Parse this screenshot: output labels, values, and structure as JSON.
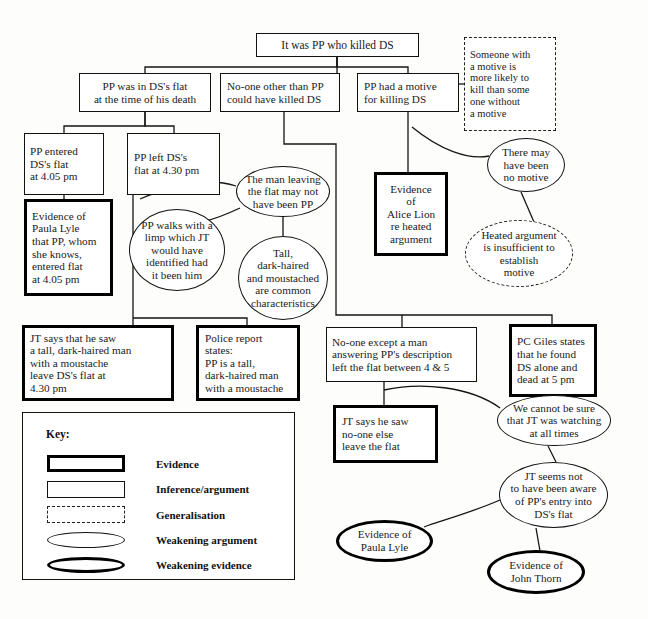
{
  "diagram": {
    "nodes": [
      {
        "id": "n1",
        "label": "It was PP who killed DS",
        "type": "inference",
        "align": "center",
        "x": 256,
        "y": 33,
        "w": 163,
        "h": 24,
        "font": 11.5,
        "pad": 4
      },
      {
        "id": "n2",
        "label": "PP was in DS's flat\nat the time of his death",
        "type": "inference",
        "align": "center",
        "x": 79,
        "y": 73,
        "w": 132,
        "h": 39,
        "font": 11.2,
        "pad": 4
      },
      {
        "id": "n3",
        "label": "No-one other than PP\ncould have killed DS",
        "type": "inference",
        "align": "left",
        "x": 220,
        "y": 73,
        "w": 120,
        "h": 39,
        "font": 11.2,
        "pad": 6
      },
      {
        "id": "n4",
        "label": "PP had a motive\nfor killing DS",
        "type": "inference",
        "align": "left",
        "x": 357,
        "y": 73,
        "w": 102,
        "h": 39,
        "font": 11.2,
        "pad": 6
      },
      {
        "id": "n5",
        "label": "Someone with\na motive is\nmore likely to\nkill than some\none without\na motive",
        "type": "generalisation",
        "align": "left",
        "x": 464,
        "y": 37,
        "w": 92,
        "h": 94,
        "font": 10.5,
        "pad": 5
      },
      {
        "id": "n6",
        "label": "PP entered\nDS's flat\nat 4.05 pm",
        "type": "inference",
        "align": "left",
        "x": 24,
        "y": 133,
        "w": 80,
        "h": 62,
        "font": 11.2,
        "pad": 5
      },
      {
        "id": "n7",
        "label": "PP left DS's\nflat at 4.30 pm",
        "type": "inference",
        "align": "left",
        "x": 127,
        "y": 133,
        "w": 93,
        "h": 62,
        "font": 11.2,
        "pad": 6
      },
      {
        "id": "n8",
        "label": "Evidence of\nPaula Lyle\nthat PP, whom\nshe knows,\nentered flat\nat 4.05 pm",
        "type": "evidence",
        "align": "left",
        "x": 24,
        "y": 199,
        "w": 89,
        "h": 97,
        "font": 11.2,
        "pad": 5
      },
      {
        "id": "n9",
        "label": "The man leaving\nthe flat may not\nhave been PP",
        "type": "wk-argument",
        "align": "center",
        "x": 236,
        "y": 166,
        "w": 94,
        "h": 51,
        "font": 11.2,
        "pad": 6
      },
      {
        "id": "n10",
        "label": "PP walks with a\nlimp which JT\nwould have\nidentified had\nit been him",
        "type": "wk-argument",
        "align": "center",
        "x": 129,
        "y": 209,
        "w": 96,
        "h": 82,
        "font": 11.2,
        "pad": 6
      },
      {
        "id": "n11",
        "label": "Tall,\ndark-haired\nand moustached\nare common\ncharacteristics",
        "type": "wk-argument",
        "align": "center",
        "x": 238,
        "y": 236,
        "w": 90,
        "h": 84,
        "font": 11.2,
        "pad": 4
      },
      {
        "id": "n12",
        "label": "Evidence\nof\nAlice Lion\nre heated\nargument",
        "type": "evidence",
        "align": "center",
        "x": 374,
        "y": 172,
        "w": 74,
        "h": 84,
        "font": 11.2,
        "pad": 4
      },
      {
        "id": "n13",
        "label": "There may\nhave been\nno motive",
        "type": "wk-argument",
        "align": "center",
        "x": 487,
        "y": 138,
        "w": 78,
        "h": 54,
        "font": 11.2,
        "pad": 4
      },
      {
        "id": "n14",
        "label": "Heated argument\nis insufficient to\nestablish\nmotive",
        "type": "generalisation-ellipse",
        "align": "center",
        "x": 465,
        "y": 220,
        "w": 108,
        "h": 67,
        "font": 11,
        "pad": 4
      },
      {
        "id": "n15",
        "label": "JT says that he saw\na tall, dark-haired man\nwith a moustache\nleave DS's flat at\n4.30 pm",
        "type": "evidence",
        "align": "left",
        "x": 22,
        "y": 325,
        "w": 152,
        "h": 76,
        "font": 11.2,
        "pad": 5
      },
      {
        "id": "n16",
        "label": "Police report\nstates:\nPP is a tall,\ndark-haired man\nwith a moustache",
        "type": "evidence",
        "align": "left",
        "x": 196,
        "y": 325,
        "w": 104,
        "h": 76,
        "font": 11.2,
        "pad": 6
      },
      {
        "id": "n17",
        "label": "No-one except a man\nanswering PP's description\nleft the flat between 4 & 5",
        "type": "inference",
        "align": "left",
        "x": 326,
        "y": 327,
        "w": 151,
        "h": 55,
        "font": 11.2,
        "pad": 5
      },
      {
        "id": "n18",
        "label": "PC Giles states\nthat he found\nDS alone and\ndead at 5 pm",
        "type": "evidence",
        "align": "left",
        "x": 509,
        "y": 324,
        "w": 88,
        "h": 73,
        "font": 11.2,
        "pad": 5
      },
      {
        "id": "n19",
        "label": "JT says he saw\nno-one else\nleave the flat",
        "type": "evidence",
        "align": "left",
        "x": 333,
        "y": 405,
        "w": 105,
        "h": 58,
        "font": 11.2,
        "pad": 6
      },
      {
        "id": "n20",
        "label": "We cannot be sure\nthat JT was watching\nat all times",
        "type": "wk-argument",
        "align": "center",
        "x": 497,
        "y": 395,
        "w": 114,
        "h": 51,
        "font": 11.2,
        "pad": 4
      },
      {
        "id": "n21",
        "label": "JT seems not\nto have been aware\nof PP's entry into\nDS's flat",
        "type": "wk-argument",
        "align": "center",
        "x": 499,
        "y": 462,
        "w": 109,
        "h": 66,
        "font": 11.2,
        "pad": 4
      },
      {
        "id": "n22",
        "label": "Evidence of\nPaula Lyle",
        "type": "wk-evidence",
        "align": "center",
        "x": 336,
        "y": 520,
        "w": 97,
        "h": 42,
        "font": 11.2,
        "pad": 4
      },
      {
        "id": "n23",
        "label": "Evidence of\nJohn Thorn",
        "type": "wk-evidence",
        "align": "center",
        "x": 487,
        "y": 550,
        "w": 98,
        "h": 44,
        "font": 11.2,
        "pad": 4
      }
    ],
    "connectors": [
      {
        "from": "n1",
        "to": "n2",
        "d": "M 337,57 L 337,67 L 145,67 L 145,73"
      },
      {
        "from": "n1",
        "to": "n3",
        "d": "M 337,57 L 337,73"
      },
      {
        "from": "n1",
        "to": "n4",
        "d": "M 337,57 L 337,67 L 408,67 L 408,73"
      },
      {
        "from": "n4",
        "to": "n5",
        "d": "M 459,84 L 464,84"
      },
      {
        "from": "n2",
        "to": "n6",
        "d": "M 145,112 L 145,126 L 64,126 L 64,133"
      },
      {
        "from": "n2",
        "to": "n7",
        "d": "M 145,112 L 145,126 L 174,126 L 174,133"
      },
      {
        "from": "n6",
        "to": "n8",
        "d": "M 64,195 L 64,199"
      },
      {
        "from": "n7",
        "to": "n15",
        "d": "M 133,195 L 133,330 L 133,332"
      },
      {
        "from": "n15",
        "to": "n16",
        "d": "M 133,318 L 247,318 L 247,325"
      },
      {
        "from": "n7",
        "to": "n9",
        "d": "M 140,199 C 170,186 205,176 236,186"
      },
      {
        "from": "n9",
        "to": "n10",
        "d": "M 240,208 C 225,215 215,219 205,221"
      },
      {
        "from": "n9",
        "to": "n11",
        "d": "M 283,217 L 283,236"
      },
      {
        "from": "n3",
        "to": "n17",
        "d": "M 284,112 L 284,144 L 336,144 L 336,315 L 402,315 L 402,327"
      },
      {
        "from": "n4",
        "to": "n12",
        "d": "M 408,112 L 408,172"
      },
      {
        "from": "n4",
        "to": "n13",
        "d": "M 412,127 C 440,150 468,160 489,156"
      },
      {
        "from": "n13",
        "to": "n14",
        "d": "M 521,192 L 534,222"
      },
      {
        "from": "n17",
        "to": "n18",
        "d": "M 402,315 L 552,315 L 552,324"
      },
      {
        "from": "n17",
        "to": "n19",
        "d": "M 384,382 L 384,405"
      },
      {
        "from": "n17",
        "to": "n20",
        "d": "M 384,390 C 420,382 470,386 500,408"
      },
      {
        "from": "n20",
        "to": "n21",
        "d": "M 548,446 L 556,462"
      },
      {
        "from": "n21",
        "to": "n22",
        "d": "M 500,500 C 470,513 440,521 424,527"
      },
      {
        "from": "n21",
        "to": "n23",
        "d": "M 536,528 L 540,551"
      }
    ]
  },
  "key": {
    "title": "Key:",
    "box": {
      "x": 22,
      "y": 412,
      "w": 273,
      "h": 168
    },
    "rows": [
      {
        "label": "Evidence",
        "shape": "evidence"
      },
      {
        "label": "Inference/argument",
        "shape": "inference"
      },
      {
        "label": "Generalisation",
        "shape": "generalisation"
      },
      {
        "label": "Weakening argument",
        "shape": "wk-argument"
      },
      {
        "label": "Weakening evidence",
        "shape": "wk-evidence"
      }
    ]
  }
}
